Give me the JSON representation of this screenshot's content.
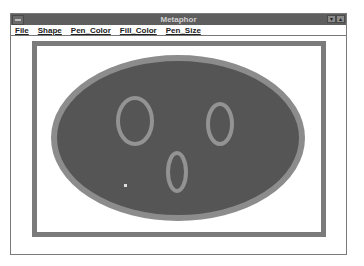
{
  "window": {
    "title": "Metaphor",
    "sysmenu_icon": "system-menu-icon",
    "minimize_icon": "▾",
    "maximize_icon": "▴"
  },
  "menubar": {
    "items": [
      {
        "label": "File"
      },
      {
        "label": "Shape"
      },
      {
        "label": "Pen_Color"
      },
      {
        "label": "Fill_Color"
      },
      {
        "label": "Pen_Size"
      }
    ]
  },
  "drawing": {
    "frame": {
      "x": 32,
      "y": 41,
      "width": 294,
      "height": 196,
      "stroke": "#7b7b7b",
      "stroke_width": 5
    },
    "face": {
      "cx": 178,
      "cy": 138,
      "rx": 124,
      "ry": 80,
      "fill": "#555555",
      "stroke": "#8c8c8c",
      "stroke_width": 6
    },
    "left_eye": {
      "cx": 135,
      "cy": 121,
      "rx": 17,
      "ry": 23,
      "stroke": "#939393",
      "stroke_width": 4
    },
    "right_eye": {
      "cx": 220,
      "cy": 124,
      "rx": 12,
      "ry": 20,
      "stroke": "#939393",
      "stroke_width": 4
    },
    "mouth": {
      "cx": 177,
      "cy": 172,
      "rx": 9,
      "ry": 19,
      "stroke": "#939393",
      "stroke_width": 4
    },
    "cursor_speck": {
      "x": 124,
      "y": 184
    }
  }
}
